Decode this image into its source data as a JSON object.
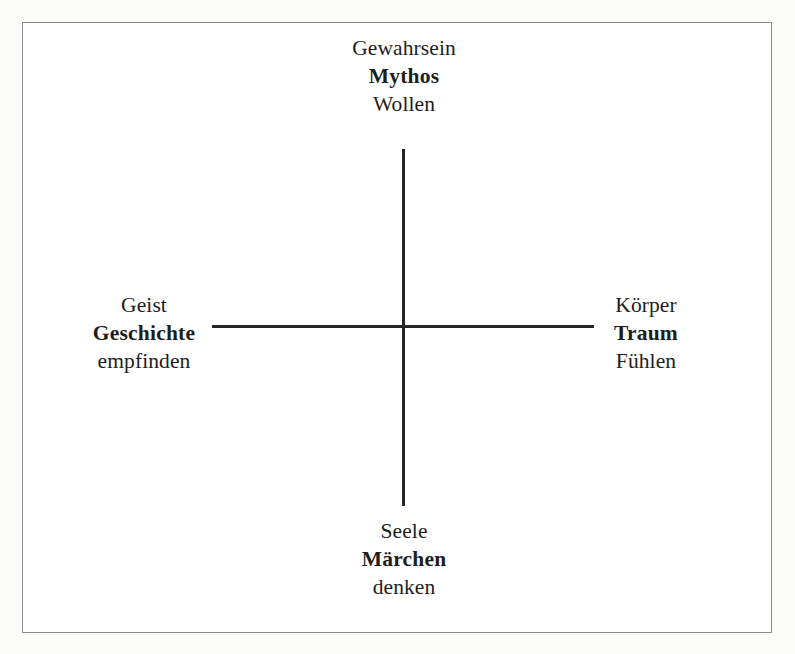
{
  "diagram": {
    "type": "cross-axes-schema",
    "title": "",
    "axes": {
      "vertical": {
        "name": "vertical-axis",
        "color": "#262626"
      },
      "horizontal": {
        "name": "horizontal-axis",
        "color": "#262626"
      }
    },
    "poles": {
      "top": {
        "upper_label": "Gewahrsein",
        "main_label": "Mythos",
        "lower_label": "Wollen"
      },
      "right": {
        "upper_label": "Körper",
        "main_label": "Traum",
        "lower_label": "Fühlen"
      },
      "bottom": {
        "upper_label": "Seele",
        "main_label": "Märchen",
        "lower_label": "denken"
      },
      "left": {
        "upper_label": "Geist",
        "main_label": "Geschichte",
        "lower_label": "empfinden"
      }
    },
    "colors": {
      "frame_border": "#8b8b8b",
      "axis": "#262626",
      "text": "#1d1d1d",
      "page_background": "#fcfcfb",
      "diagram_background": "#ffffff"
    }
  }
}
